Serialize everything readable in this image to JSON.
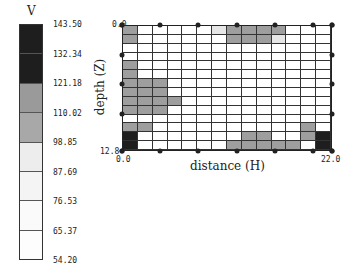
{
  "chart_data": {
    "type": "heatmap",
    "title": "",
    "colorbar": {
      "label": "V",
      "ticks": [
        "143.50",
        "132.34",
        "121.18",
        "110.02",
        "98.85",
        "87.69",
        "76.53",
        "65.37",
        "54.20"
      ],
      "colors": [
        "#1e1e1e",
        "#1e1e1e",
        "#9a9a9a",
        "#a8a8a8",
        "#ededed",
        "#f4f4f4",
        "#fafafa",
        "#fdfdfd"
      ]
    },
    "xlabel": "distance (H)",
    "ylabel": "depth (Z)",
    "xlim": [
      0.0,
      22.0
    ],
    "ylim": [
      0.0,
      12.8
    ],
    "x_tick_labels": [
      "0.0",
      "22.0"
    ],
    "y_tick_labels": [
      "0.0",
      "12.8"
    ],
    "grid": {
      "columns": 14,
      "rows": 14,
      "levels_legend": {
        "0": "white",
        "1": "light",
        "2": "gray",
        "3": "dark"
      },
      "cells": [
        [
          2,
          0,
          0,
          0,
          0,
          0,
          1,
          2,
          2,
          2,
          2,
          0,
          0,
          0
        ],
        [
          2,
          0,
          0,
          0,
          0,
          0,
          0,
          2,
          2,
          2,
          1,
          0,
          0,
          0
        ],
        [
          0,
          0,
          0,
          0,
          0,
          0,
          0,
          0,
          0,
          0,
          0,
          0,
          0,
          0
        ],
        [
          0,
          0,
          0,
          0,
          0,
          0,
          0,
          0,
          0,
          0,
          0,
          0,
          0,
          0
        ],
        [
          2,
          0,
          0,
          0,
          0,
          0,
          0,
          0,
          0,
          0,
          0,
          0,
          0,
          0
        ],
        [
          2,
          0,
          0,
          0,
          0,
          0,
          0,
          0,
          0,
          0,
          0,
          0,
          0,
          0
        ],
        [
          2,
          2,
          2,
          0,
          0,
          0,
          0,
          0,
          0,
          0,
          0,
          0,
          0,
          0
        ],
        [
          2,
          2,
          2,
          0,
          0,
          0,
          0,
          0,
          0,
          0,
          0,
          0,
          0,
          0
        ],
        [
          2,
          2,
          2,
          2,
          0,
          0,
          0,
          0,
          0,
          0,
          0,
          0,
          0,
          0
        ],
        [
          2,
          2,
          2,
          0,
          0,
          0,
          0,
          0,
          0,
          0,
          0,
          0,
          0,
          0
        ],
        [
          0,
          0,
          0,
          0,
          0,
          0,
          0,
          0,
          0,
          0,
          0,
          0,
          0,
          0
        ],
        [
          2,
          2,
          0,
          0,
          0,
          0,
          0,
          0,
          0,
          0,
          0,
          0,
          2,
          0
        ],
        [
          3,
          0,
          0,
          0,
          0,
          0,
          0,
          0,
          2,
          2,
          0,
          0,
          2,
          3
        ],
        [
          3,
          0,
          0,
          0,
          0,
          0,
          0,
          2,
          2,
          2,
          2,
          2,
          0,
          3
        ]
      ]
    },
    "electrodes_top_x": [
      0.0,
      4.0,
      8.0,
      12.0,
      16.0,
      20.0,
      22.0
    ],
    "electrodes_left_z": [
      0.0,
      3.0,
      6.0,
      9.0,
      12.8
    ]
  },
  "labels": {
    "v": "V",
    "x_start": "0.0",
    "x_end": "22.0",
    "y_top": "0.0",
    "y_bottom": "12.8",
    "xlabel": "distance (H)",
    "ylabel": "depth (Z)"
  }
}
